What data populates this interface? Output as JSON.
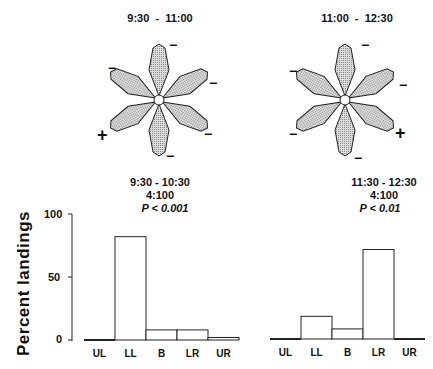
{
  "flowers": [
    {
      "title": "9:30  -  11:00",
      "signs": [
        "−",
        "−",
        "−",
        "−",
        "−",
        "+"
      ]
    },
    {
      "title": "11:00  -  12:30",
      "signs": [
        "−",
        "−",
        "−",
        "+",
        "−",
        "−"
      ]
    }
  ],
  "chart_data": [
    {
      "type": "bar",
      "title": "9:30 - 10:30",
      "subtitle": "4:100",
      "annotation": "P < 0.001",
      "categories": [
        "UL",
        "LL",
        "B",
        "LR",
        "UR"
      ],
      "values": [
        0,
        82,
        8,
        8,
        2
      ],
      "xlabel": "",
      "ylabel": "Percent landings",
      "yticks": [
        0,
        50,
        100
      ],
      "ylim": [
        0,
        100
      ],
      "grid": false
    },
    {
      "type": "bar",
      "title": "11:30 - 12:30",
      "subtitle": "4:100",
      "annotation": "P < 0.01",
      "categories": [
        "UL",
        "LL",
        "B",
        "LR",
        "UR"
      ],
      "values": [
        0,
        18,
        8,
        71,
        0
      ],
      "xlabel": "",
      "ylabel": "Percent landings",
      "ylim": [
        0,
        100
      ],
      "grid": false
    }
  ],
  "axis": {
    "ylabel": "Percent landings",
    "ticks": [
      "100",
      "50",
      "0"
    ]
  }
}
